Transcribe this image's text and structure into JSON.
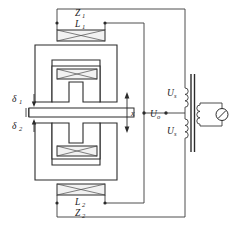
{
  "figure": {
    "type": "circuit-schematic"
  },
  "labels": {
    "impedance_top": "Z",
    "impedance_top_sub": "1",
    "inductance_top": "L",
    "inductance_top_sub": "1",
    "inductance_bottom": "L",
    "inductance_bottom_sub": "2",
    "impedance_bottom": "Z",
    "impedance_bottom_sub": "2",
    "gap_top": "δ",
    "gap_top_sub": "1",
    "gap_bottom": "δ",
    "gap_bottom_sub": "2",
    "displacement": "x",
    "output_voltage": "U",
    "output_voltage_sub": "o",
    "supply_top": "U",
    "supply_top_sub": "s",
    "supply_bottom": "U",
    "supply_bottom_sub": "s"
  },
  "components": {
    "meter": "meter-indicator",
    "transformer": "center-tapped-transformer",
    "armature": "moving-armature-plate",
    "core_top": "e-shaped-upper-core",
    "core_bottom": "e-shaped-lower-core"
  },
  "colors": {
    "line": "#2b2b2b",
    "wire": "#3a3a3a",
    "coil_fill": "#f2f2f2",
    "background": "#ffffff"
  }
}
